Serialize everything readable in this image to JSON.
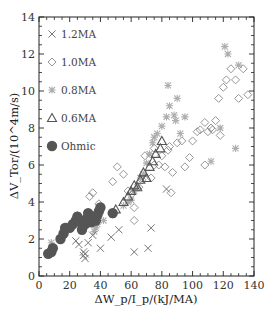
{
  "chart_data": {
    "type": "scatter",
    "title": "",
    "xlabel": "ΔW_p/I_p/(kJ/MA)",
    "ylabel": "ΔV_Tor/(10^4m/s)",
    "xlim": [
      0,
      140
    ],
    "ylim": [
      0,
      14
    ],
    "xticks": [
      0,
      20,
      40,
      60,
      80,
      100,
      120,
      140
    ],
    "yticks": [
      0,
      2,
      4,
      6,
      8,
      10,
      12,
      14
    ],
    "grid": false,
    "legend_position": "upper left",
    "series": [
      {
        "name": "1.2MA",
        "marker": "x",
        "color": "#777777",
        "points": [
          [
            24,
            1.9
          ],
          [
            26,
            1.7
          ],
          [
            29,
            1.3
          ],
          [
            29,
            1.1
          ],
          [
            30,
            1.2
          ],
          [
            30,
            0.95
          ],
          [
            32,
            1.8
          ],
          [
            35,
            2.2
          ],
          [
            40,
            1.5
          ],
          [
            47,
            2.1
          ],
          [
            52,
            2.5
          ],
          [
            73,
            2.6
          ],
          [
            83,
            4.7
          ],
          [
            62,
            1.3
          ],
          [
            71,
            1.5
          ]
        ]
      },
      {
        "name": "1.0MA",
        "marker": "diamond-open",
        "color": "#8a8a8a",
        "points": [
          [
            33,
            4.3
          ],
          [
            35,
            4.5
          ],
          [
            39,
            3.9
          ],
          [
            48,
            5.1
          ],
          [
            51,
            5.9
          ],
          [
            55,
            5.5
          ],
          [
            58,
            4.6
          ],
          [
            60,
            4.4
          ],
          [
            62,
            3.7
          ],
          [
            65,
            4.8
          ],
          [
            67,
            5.2
          ],
          [
            69,
            6.5
          ],
          [
            73,
            5.3
          ],
          [
            75,
            6.0
          ],
          [
            75,
            6.9
          ],
          [
            78,
            6.0
          ],
          [
            80,
            6.5
          ],
          [
            82,
            5.9
          ],
          [
            84,
            6.8
          ],
          [
            85,
            7.0
          ],
          [
            87,
            5.6
          ],
          [
            90,
            7.2
          ],
          [
            93,
            7.3
          ],
          [
            95,
            5.9
          ],
          [
            98,
            6.4
          ],
          [
            100,
            7.3
          ],
          [
            103,
            7.8
          ],
          [
            105,
            7.9
          ],
          [
            108,
            8.3
          ],
          [
            110,
            7.8
          ],
          [
            112,
            8.0
          ],
          [
            113,
            7.9
          ],
          [
            115,
            8.4
          ],
          [
            117,
            9.6
          ],
          [
            118,
            7.6
          ],
          [
            120,
            10.2
          ],
          [
            122,
            10.6
          ],
          [
            125,
            11.2
          ],
          [
            128,
            10.6
          ],
          [
            130,
            9.6
          ],
          [
            133,
            11.2
          ],
          [
            136,
            9.8
          ],
          [
            108,
            6.0
          ],
          [
            86,
            4.5
          ],
          [
            62,
            3.0
          ]
        ]
      },
      {
        "name": "0.8MA",
        "marker": "asterisk",
        "color": "#a0a0a0",
        "points": [
          [
            8,
            1.8
          ],
          [
            18,
            2.7
          ],
          [
            25,
            3.3
          ],
          [
            36,
            2.4
          ],
          [
            37,
            2.6
          ],
          [
            38,
            2.8
          ],
          [
            42,
            3.0
          ],
          [
            48,
            3.3
          ],
          [
            55,
            3.8
          ],
          [
            58,
            4.0
          ],
          [
            60,
            4.1
          ],
          [
            62,
            4.6
          ],
          [
            64,
            4.8
          ],
          [
            66,
            5.3
          ],
          [
            68,
            5.5
          ],
          [
            70,
            6.1
          ],
          [
            72,
            6.6
          ],
          [
            74,
            7.2
          ],
          [
            77,
            7.7
          ],
          [
            80,
            8.1
          ],
          [
            83,
            8.6
          ],
          [
            85,
            9.2
          ],
          [
            88,
            8.7
          ],
          [
            89,
            8.4
          ],
          [
            92,
            7.7
          ],
          [
            95,
            8.6
          ],
          [
            75,
            7.5
          ],
          [
            84,
            10.3
          ],
          [
            90,
            9.6
          ],
          [
            118,
            8.0
          ],
          [
            121,
            12.4
          ],
          [
            123,
            12.0
          ],
          [
            130,
            11.4
          ],
          [
            128,
            6.9
          ],
          [
            112,
            6.2
          ]
        ]
      },
      {
        "name": "0.6MA",
        "marker": "triangle-open",
        "color": "#555555",
        "points": [
          [
            50,
            3.6
          ],
          [
            55,
            4.0
          ],
          [
            58,
            4.3
          ],
          [
            60,
            4.6
          ],
          [
            62,
            4.9
          ],
          [
            64,
            4.8
          ],
          [
            66,
            5.2
          ],
          [
            68,
            5.6
          ],
          [
            70,
            5.3
          ],
          [
            72,
            5.9
          ],
          [
            74,
            6.2
          ],
          [
            76,
            6.6
          ],
          [
            79,
            6.9
          ],
          [
            80,
            7.3
          ]
        ]
      },
      {
        "name": "Ohmic",
        "marker": "circle-filled",
        "color": "#555555",
        "points": [
          [
            6,
            1.2
          ],
          [
            8,
            1.3
          ],
          [
            9,
            1.5
          ],
          [
            14,
            2.0
          ],
          [
            16,
            2.3
          ],
          [
            17,
            2.6
          ],
          [
            20,
            2.6
          ],
          [
            22,
            2.8
          ],
          [
            24,
            3.0
          ],
          [
            25,
            3.2
          ],
          [
            27,
            2.9
          ],
          [
            28,
            2.5
          ],
          [
            30,
            2.8
          ],
          [
            31,
            3.1
          ],
          [
            32,
            3.4
          ],
          [
            34,
            2.9
          ],
          [
            35,
            3.2
          ],
          [
            37,
            3.0
          ],
          [
            38,
            3.3
          ],
          [
            39,
            3.5
          ],
          [
            40,
            3.7
          ],
          [
            48,
            3.4
          ]
        ]
      }
    ]
  }
}
